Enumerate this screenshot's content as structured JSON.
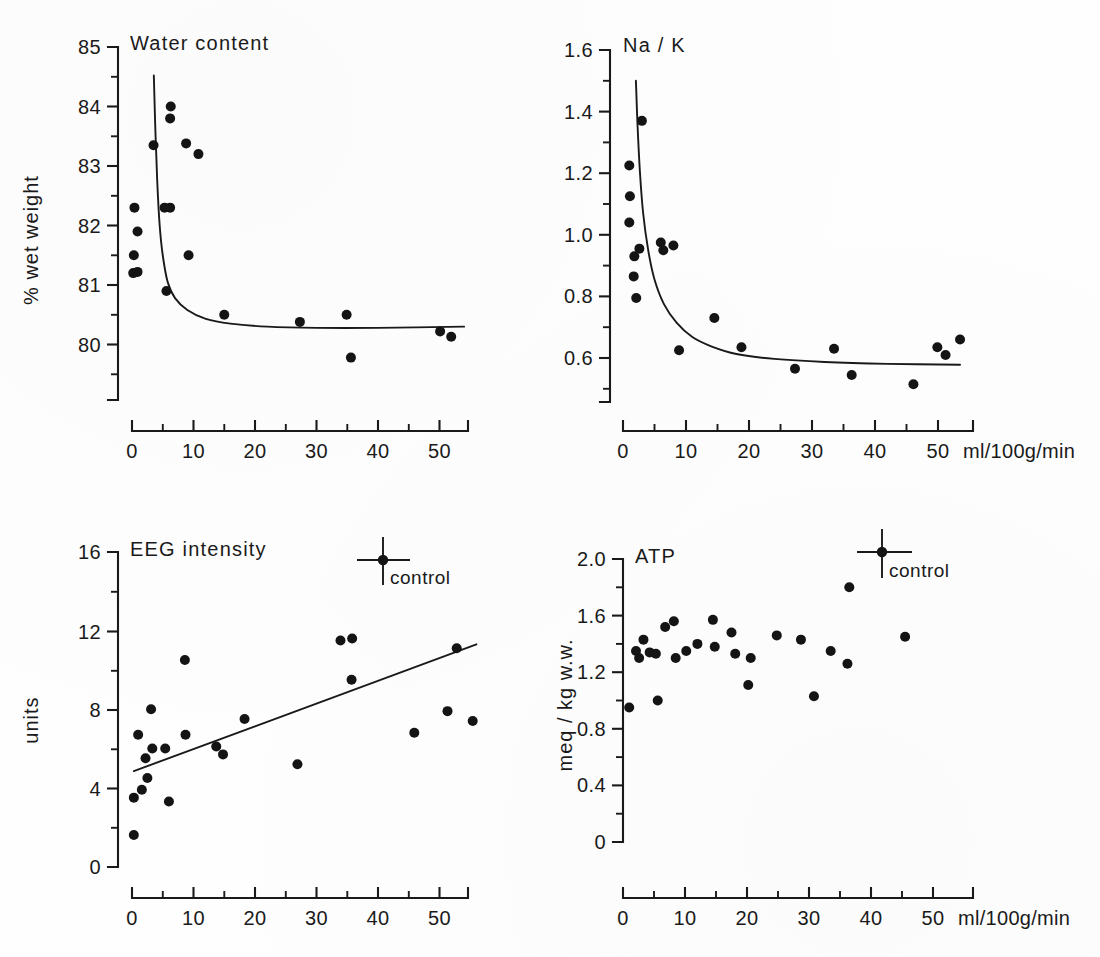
{
  "figure": {
    "background": "#fefefe",
    "ink": "#141414",
    "width": 1100,
    "height": 957,
    "shared_x_unit_label": "ml/100g/min"
  },
  "chart_data": [
    {
      "id": "water-content",
      "type": "scatter",
      "title": "Water content",
      "xlabel": "",
      "ylabel": "% wet weight",
      "xlim": [
        0,
        54.5
      ],
      "ylim": [
        79.1,
        85.0
      ],
      "grid": false,
      "legend": null,
      "xticks": [
        0,
        10,
        20,
        30,
        40,
        50
      ],
      "xticklabels": [
        "0",
        "10",
        "20",
        "30",
        "40",
        "50"
      ],
      "xminorticks": [
        5,
        15,
        25,
        35,
        45
      ],
      "yticks": [
        80,
        81,
        82,
        83,
        84,
        85
      ],
      "yticklabels": [
        "80",
        "81",
        "82",
        "83",
        "84",
        "85"
      ],
      "yminorticks": [
        79.5,
        80.5,
        81.5,
        82.5,
        83.5,
        84.5
      ],
      "points": [
        {
          "x": 0.4,
          "y": 82.3
        },
        {
          "x": 0.9,
          "y": 81.9
        },
        {
          "x": 0.3,
          "y": 81.5
        },
        {
          "x": 0.2,
          "y": 81.2
        },
        {
          "x": 0.9,
          "y": 81.22
        },
        {
          "x": 3.5,
          "y": 83.35
        },
        {
          "x": 5.3,
          "y": 82.3
        },
        {
          "x": 6.2,
          "y": 82.3
        },
        {
          "x": 6.3,
          "y": 84.0
        },
        {
          "x": 6.2,
          "y": 83.8
        },
        {
          "x": 5.6,
          "y": 80.9
        },
        {
          "x": 8.8,
          "y": 83.38
        },
        {
          "x": 9.2,
          "y": 81.5
        },
        {
          "x": 10.8,
          "y": 83.2
        },
        {
          "x": 15.0,
          "y": 80.5
        },
        {
          "x": 27.3,
          "y": 80.38
        },
        {
          "x": 34.9,
          "y": 80.5
        },
        {
          "x": 35.6,
          "y": 79.78
        },
        {
          "x": 50.1,
          "y": 80.22
        },
        {
          "x": 51.9,
          "y": 80.13
        }
      ],
      "fit": {
        "kind": "decay",
        "description": "steep hyperbolic decay to plateau ~80.3",
        "samples": [
          {
            "x": 3.55,
            "y": 84.52
          },
          {
            "x": 3.8,
            "y": 83.6
          },
          {
            "x": 4.1,
            "y": 82.75
          },
          {
            "x": 4.5,
            "y": 82.0
          },
          {
            "x": 5.0,
            "y": 81.5
          },
          {
            "x": 5.8,
            "y": 81.05
          },
          {
            "x": 7.0,
            "y": 80.78
          },
          {
            "x": 9.0,
            "y": 80.58
          },
          {
            "x": 12.0,
            "y": 80.43
          },
          {
            "x": 16.0,
            "y": 80.35
          },
          {
            "x": 22.0,
            "y": 80.3
          },
          {
            "x": 30.0,
            "y": 80.28
          },
          {
            "x": 40.0,
            "y": 80.28
          },
          {
            "x": 54.0,
            "y": 80.3
          }
        ]
      }
    },
    {
      "id": "na-k",
      "type": "scatter",
      "title": "Na / K",
      "xlabel": "ml/100g/min",
      "ylabel": "",
      "xlim": [
        0,
        54.5
      ],
      "ylim": [
        0.47,
        1.6
      ],
      "grid": false,
      "legend": null,
      "xticks": [
        0,
        10,
        20,
        30,
        40,
        50
      ],
      "xticklabels": [
        "0",
        "10",
        "20",
        "30",
        "40",
        "50"
      ],
      "xminorticks": [
        5,
        15,
        25,
        35,
        45
      ],
      "yticks": [
        0.6,
        0.8,
        1.0,
        1.2,
        1.4,
        1.6
      ],
      "yticklabels": [
        "0.6",
        "0.8",
        "1.0",
        "1.2",
        "1.4",
        "1.6"
      ],
      "yminorticks": [
        0.5,
        0.7,
        0.9,
        1.1,
        1.3,
        1.5
      ],
      "points": [
        {
          "x": 1.0,
          "y": 1.225
        },
        {
          "x": 1.1,
          "y": 1.125
        },
        {
          "x": 1.0,
          "y": 1.04
        },
        {
          "x": 1.8,
          "y": 0.93
        },
        {
          "x": 1.7,
          "y": 0.865
        },
        {
          "x": 2.1,
          "y": 0.795
        },
        {
          "x": 3.0,
          "y": 1.37
        },
        {
          "x": 2.6,
          "y": 0.955
        },
        {
          "x": 6.0,
          "y": 0.975
        },
        {
          "x": 6.4,
          "y": 0.95
        },
        {
          "x": 8.0,
          "y": 0.965
        },
        {
          "x": 8.9,
          "y": 0.625
        },
        {
          "x": 14.5,
          "y": 0.73
        },
        {
          "x": 18.8,
          "y": 0.635
        },
        {
          "x": 27.3,
          "y": 0.565
        },
        {
          "x": 33.5,
          "y": 0.63
        },
        {
          "x": 36.3,
          "y": 0.545
        },
        {
          "x": 46.1,
          "y": 0.515
        },
        {
          "x": 49.9,
          "y": 0.635
        },
        {
          "x": 51.2,
          "y": 0.61
        },
        {
          "x": 53.5,
          "y": 0.66
        }
      ],
      "fit": {
        "kind": "decay",
        "description": "hyperbolic decay to plateau ~0.58",
        "samples": [
          {
            "x": 2.05,
            "y": 1.5
          },
          {
            "x": 2.3,
            "y": 1.36
          },
          {
            "x": 2.7,
            "y": 1.2
          },
          {
            "x": 3.2,
            "y": 1.07
          },
          {
            "x": 4.0,
            "y": 0.95
          },
          {
            "x": 5.0,
            "y": 0.855
          },
          {
            "x": 6.5,
            "y": 0.775
          },
          {
            "x": 8.5,
            "y": 0.715
          },
          {
            "x": 11.0,
            "y": 0.668
          },
          {
            "x": 14.0,
            "y": 0.638
          },
          {
            "x": 18.0,
            "y": 0.613
          },
          {
            "x": 24.0,
            "y": 0.597
          },
          {
            "x": 32.0,
            "y": 0.587
          },
          {
            "x": 42.0,
            "y": 0.581
          },
          {
            "x": 53.5,
            "y": 0.578
          }
        ]
      }
    },
    {
      "id": "eeg-intensity",
      "type": "scatter",
      "title": "EEG intensity",
      "xlabel": "",
      "ylabel": "units",
      "xlim": [
        0,
        56.0
      ],
      "ylim": [
        0,
        16.0
      ],
      "grid": false,
      "legend": null,
      "xticks": [
        0,
        10,
        20,
        30,
        40,
        50
      ],
      "xticklabels": [
        "0",
        "10",
        "20",
        "30",
        "40",
        "50"
      ],
      "xminorticks": [
        5,
        15,
        25,
        35,
        45
      ],
      "yticks": [
        0,
        4,
        8,
        12,
        16
      ],
      "yticklabels": [
        "0",
        "4",
        "8",
        "12",
        "16"
      ],
      "yminorticks": [
        2,
        6,
        10,
        14
      ],
      "points": [
        {
          "x": 0.3,
          "y": 1.6
        },
        {
          "x": 0.3,
          "y": 3.5
        },
        {
          "x": 1.0,
          "y": 6.7
        },
        {
          "x": 1.6,
          "y": 3.9
        },
        {
          "x": 2.2,
          "y": 5.5
        },
        {
          "x": 2.5,
          "y": 4.5
        },
        {
          "x": 3.1,
          "y": 8.0
        },
        {
          "x": 3.3,
          "y": 6.0
        },
        {
          "x": 5.4,
          "y": 6.0
        },
        {
          "x": 6.0,
          "y": 3.3
        },
        {
          "x": 8.6,
          "y": 10.5
        },
        {
          "x": 8.7,
          "y": 6.7
        },
        {
          "x": 13.7,
          "y": 6.1
        },
        {
          "x": 14.8,
          "y": 5.7
        },
        {
          "x": 18.3,
          "y": 7.5
        },
        {
          "x": 26.9,
          "y": 5.2
        },
        {
          "x": 33.9,
          "y": 11.5
        },
        {
          "x": 35.8,
          "y": 11.6
        },
        {
          "x": 35.7,
          "y": 9.5
        },
        {
          "x": 45.9,
          "y": 6.8
        },
        {
          "x": 51.3,
          "y": 7.9
        },
        {
          "x": 52.8,
          "y": 11.1
        },
        {
          "x": 55.4,
          "y": 7.4
        }
      ],
      "fit": {
        "kind": "linear",
        "description": "positive linear regression",
        "samples": [
          {
            "x": 0.3,
            "y": 4.85
          },
          {
            "x": 56.0,
            "y": 11.3
          }
        ]
      },
      "annotation": {
        "name": "control",
        "label": "control",
        "x": 41.0,
        "y": 15.4,
        "x_error": 4.0,
        "y_error_up": 1.15,
        "y_error_down": 1.25
      }
    },
    {
      "id": "atp",
      "type": "scatter",
      "title": "ATP",
      "xlabel": "ml/100g/min",
      "ylabel": "meq / kg w.w.",
      "xlim": [
        0,
        52.0
      ],
      "ylim": [
        0,
        2.0
      ],
      "grid": false,
      "legend": null,
      "xticks": [
        0,
        10,
        20,
        30,
        40,
        50
      ],
      "xticklabels": [
        "0",
        "10",
        "20",
        "30",
        "40",
        "50"
      ],
      "xminorticks": [
        5,
        15,
        25,
        35,
        45
      ],
      "yticks": [
        0,
        0.4,
        0.8,
        1.2,
        1.6,
        2.0
      ],
      "yticklabels": [
        "0",
        "0.4",
        "0.8",
        "1.2",
        "1.6",
        "2.0"
      ],
      "yminorticks": [
        0.2,
        0.6,
        1.0,
        1.4,
        1.8
      ],
      "points": [
        {
          "x": 1.0,
          "y": 0.95
        },
        {
          "x": 2.1,
          "y": 1.35
        },
        {
          "x": 2.6,
          "y": 1.3
        },
        {
          "x": 3.3,
          "y": 1.43
        },
        {
          "x": 4.3,
          "y": 1.34
        },
        {
          "x": 5.3,
          "y": 1.33
        },
        {
          "x": 5.6,
          "y": 1.0
        },
        {
          "x": 6.8,
          "y": 1.52
        },
        {
          "x": 8.2,
          "y": 1.56
        },
        {
          "x": 8.5,
          "y": 1.3
        },
        {
          "x": 10.2,
          "y": 1.35
        },
        {
          "x": 12.0,
          "y": 1.4
        },
        {
          "x": 14.5,
          "y": 1.57
        },
        {
          "x": 14.8,
          "y": 1.38
        },
        {
          "x": 17.5,
          "y": 1.48
        },
        {
          "x": 18.1,
          "y": 1.33
        },
        {
          "x": 20.2,
          "y": 1.11
        },
        {
          "x": 20.6,
          "y": 1.3
        },
        {
          "x": 24.8,
          "y": 1.46
        },
        {
          "x": 28.7,
          "y": 1.43
        },
        {
          "x": 30.8,
          "y": 1.03
        },
        {
          "x": 33.5,
          "y": 1.35
        },
        {
          "x": 36.2,
          "y": 1.26
        },
        {
          "x": 36.5,
          "y": 1.8
        },
        {
          "x": 45.5,
          "y": 1.45
        }
      ],
      "fit": null,
      "annotation": {
        "name": "control",
        "label": "control",
        "x": 41.5,
        "y": 2.0,
        "x_error": 4.2,
        "y_error_up": 0.32,
        "y_error_down": 0.38
      }
    }
  ]
}
